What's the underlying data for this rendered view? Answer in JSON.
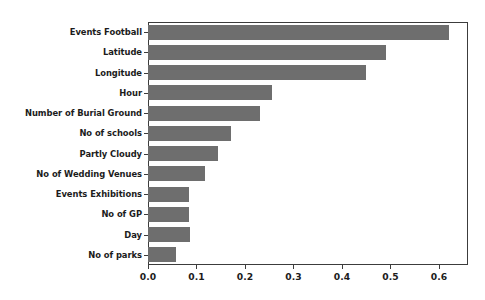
{
  "chart_data": {
    "type": "bar",
    "orientation": "horizontal",
    "title": "",
    "xlabel": "",
    "ylabel": "",
    "xlim": [
      0.0,
      0.66
    ],
    "ylim": null,
    "grid": false,
    "legend": null,
    "bar_color": "#6e6e6e",
    "axis_color": "#3c3c3c",
    "background_color": "#ffffff",
    "xticks": [
      "0.0",
      "0.1",
      "0.2",
      "0.3",
      "0.4",
      "0.5",
      "0.6"
    ],
    "xtick_values": [
      0.0,
      0.1,
      0.2,
      0.3,
      0.4,
      0.5,
      0.6
    ],
    "categories": [
      "Events Football",
      "Latitude",
      "Longitude",
      "Hour",
      "Number of Burial Ground",
      "No of schools",
      "Partly Cloudy",
      "No of Wedding Venues",
      "Events Exhibitions",
      "No of GP",
      "Day",
      "No of parks"
    ],
    "values": [
      0.62,
      0.49,
      0.45,
      0.255,
      0.232,
      0.172,
      0.145,
      0.118,
      0.085,
      0.085,
      0.086,
      0.058
    ]
  }
}
